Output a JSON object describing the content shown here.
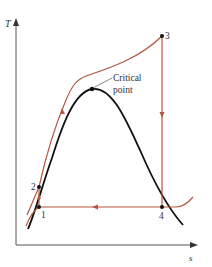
{
  "diagram": {
    "axes": {
      "y_label": "T",
      "x_label": "s"
    },
    "states": [
      {
        "id": "1",
        "label": "1"
      },
      {
        "id": "2",
        "label": "2"
      },
      {
        "id": "3",
        "label": "3"
      },
      {
        "id": "4",
        "label": "4"
      }
    ],
    "annotation": {
      "line1": "Critical",
      "line2": "point"
    },
    "colors": {
      "cycle": "#b5563f",
      "dome": "#111111",
      "axes": "#444444"
    }
  }
}
